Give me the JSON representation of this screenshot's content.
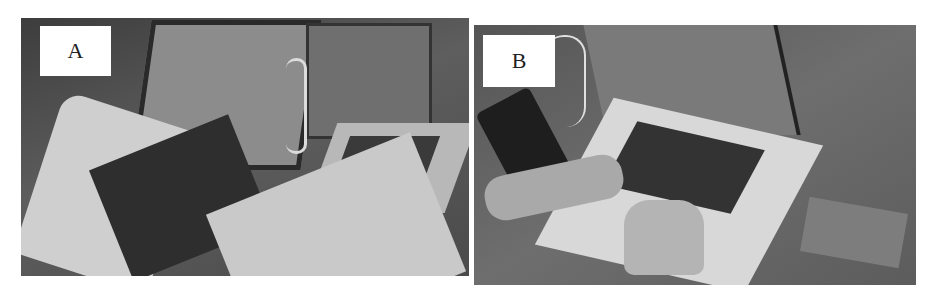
{
  "figure": {
    "panels": [
      {
        "label": "A",
        "description": "Photo of a tablet with keyboard cover and a laptop on a table, with two printed worksheets in the foreground"
      },
      {
        "label": "B",
        "description": "Overhead photo of hands typing on a laptop keyboard, with a phone and a printed card on the table"
      }
    ],
    "colors": {
      "background": "#ffffff",
      "label_box": "#ffffff",
      "photo_tone": "grayscale"
    }
  }
}
